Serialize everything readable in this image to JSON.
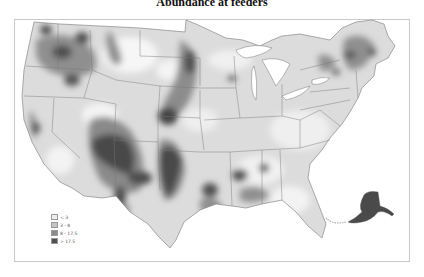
{
  "title": "Abundance at feeders",
  "map": {
    "region": "United States (contiguous) with Alaska inset",
    "colors": {
      "background": "#ffffff",
      "level_1": "#eeeeee",
      "level_2": "#c4c4c4",
      "level_3": "#8c8c8c",
      "level_4": "#4f4f4f",
      "boundaries": "#777777"
    }
  },
  "legend": {
    "items": [
      {
        "label": "< 3",
        "color": "#eeeeee"
      },
      {
        "label": "3 - 8",
        "color": "#c4c4c4"
      },
      {
        "label": "8 - 17.5",
        "color": "#8c8c8c"
      },
      {
        "label": "> 17.5",
        "color": "#4f4f4f"
      }
    ]
  }
}
